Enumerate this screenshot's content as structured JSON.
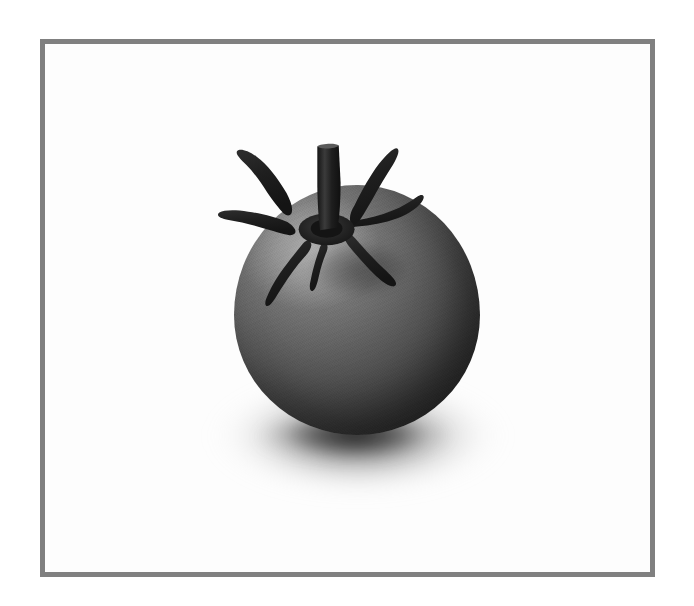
{
  "scene": {
    "type": "photograph",
    "subject": "tomato",
    "rendering": "black-and-white / grayscale",
    "background_color": "#ffffff",
    "canvas": {
      "width": 694,
      "height": 606
    }
  },
  "frame": {
    "name": "photo-frame",
    "border_color": "#808080",
    "border_width_px": 5,
    "x": 40,
    "y": 39,
    "width": 615,
    "height": 538,
    "plate_color": "#fdfdfd"
  },
  "subject": {
    "name": "tomato",
    "label": "Tomato",
    "body": {
      "center_x": 357,
      "center_y": 310,
      "width": 246,
      "height": 250,
      "highlight_position": "upper-left",
      "highlight_color": "#8d8d8d",
      "midtone_color": "#5b5b5b",
      "shadow_color": "#232323"
    },
    "stem": {
      "name": "stem",
      "top_x": 348,
      "top_y": 155,
      "length_px": 92,
      "color": "#1c1c1c"
    },
    "sepal_count": 7,
    "calyx_center_x": 348,
    "calyx_center_y": 246,
    "calyx_color": "#232323"
  },
  "shadow": {
    "name": "cast-shadow",
    "center_x": 358,
    "center_y": 440,
    "width": 300,
    "height": 125,
    "core_color": "#282828",
    "falloff": "radial-soft"
  },
  "lighting": {
    "key_light_direction": "upper-left",
    "contrast": "high",
    "palette": [
      "#ffffff",
      "#8d8d8d",
      "#5b5b5b",
      "#343434",
      "#1c1c1c"
    ]
  }
}
